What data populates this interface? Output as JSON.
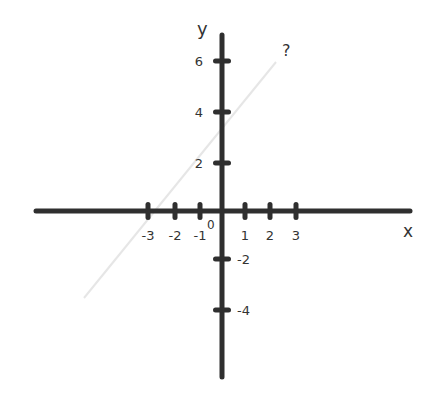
{
  "diagram": {
    "type": "coordinate-plane",
    "axis_labels": {
      "x": "x",
      "y": "y"
    },
    "origin_label": "0",
    "x_ticks": [
      {
        "value": -3,
        "label": "-3",
        "px": 148
      },
      {
        "value": -2,
        "label": "-2",
        "px": 175
      },
      {
        "value": -1,
        "label": "-1",
        "px": 200
      },
      {
        "value": 1,
        "label": "1",
        "px": 245
      },
      {
        "value": 2,
        "label": "2",
        "px": 270
      },
      {
        "value": 3,
        "label": "3",
        "px": 296
      }
    ],
    "y_ticks": [
      {
        "value": 6,
        "label": "6",
        "py": 61
      },
      {
        "value": 4,
        "label": "4",
        "py": 112
      },
      {
        "value": 2,
        "label": "2",
        "py": 163
      },
      {
        "value": -2,
        "label": "-2",
        "py": 259
      },
      {
        "value": -4,
        "label": "-4",
        "py": 310
      }
    ],
    "line_label": "?",
    "colors": {
      "axis": "#2f2f2f",
      "faint_line": "#e6e6e6",
      "text": "#333333"
    }
  }
}
